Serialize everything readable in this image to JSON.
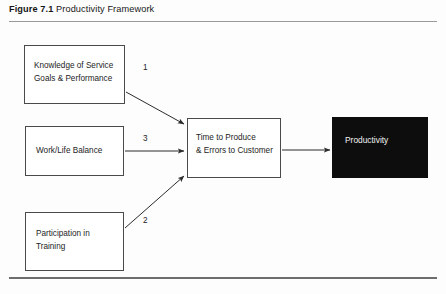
{
  "figure": {
    "caption_label": "Figure 7.1",
    "caption_title": "Productivity Framework"
  },
  "nodes": {
    "knowledge": {
      "text": "Knowledge of Service\nGoals & Performance"
    },
    "worklife": {
      "text": "Work/Life Balance"
    },
    "training": {
      "text": "Participation in\nTraining"
    },
    "outcome": {
      "text": "Time to Produce\n& Errors to Customer"
    },
    "productivity": {
      "text": "Productivity"
    }
  },
  "edges": {
    "knowledge_to_outcome": {
      "label": "1"
    },
    "worklife_to_outcome": {
      "label": "3"
    },
    "training_to_outcome": {
      "label": "2"
    }
  },
  "colors": {
    "box_border": "#4a4a4a",
    "box_fill": "#ffffff",
    "productivity_fill": "#0d0d0d",
    "productivity_text": "#f4f4f4",
    "arrow": "#2b2b2b",
    "rule": "#6d6d6d",
    "page_background": "#fdfdfd"
  }
}
